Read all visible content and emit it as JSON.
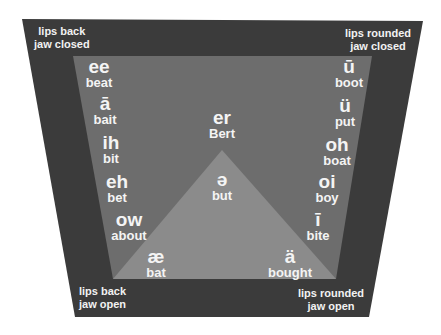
{
  "diagram": {
    "colors": {
      "outer": "#3b3b3b",
      "inner": "#6d6d6d",
      "triangle": "#8b8b8b",
      "text": "#f4f4f4",
      "background": "#ffffff"
    },
    "corners": {
      "top_left": "lips back\njaw closed",
      "top_right": "lips rounded\njaw closed",
      "bottom_left": "lips back\njaw open",
      "bottom_right": "lips rounded\njaw open"
    },
    "left_column": [
      {
        "sound": "ee",
        "word": "beat"
      },
      {
        "sound": "ā",
        "word": "bait"
      },
      {
        "sound": "ih",
        "word": "bit"
      },
      {
        "sound": "eh",
        "word": "bet"
      },
      {
        "sound": "ow",
        "word": "about"
      },
      {
        "sound": "æ",
        "word": "bat"
      }
    ],
    "right_column": [
      {
        "sound": "ū",
        "word": "boot"
      },
      {
        "sound": "ü",
        "word": "put"
      },
      {
        "sound": "oh",
        "word": "boat"
      },
      {
        "sound": "oi",
        "word": "boy"
      },
      {
        "sound": "ī",
        "word": "bite"
      },
      {
        "sound": "ä",
        "word": "bought"
      }
    ],
    "center": [
      {
        "sound": "er",
        "word": "Bert"
      },
      {
        "sound": "ə",
        "word": "but"
      }
    ]
  }
}
